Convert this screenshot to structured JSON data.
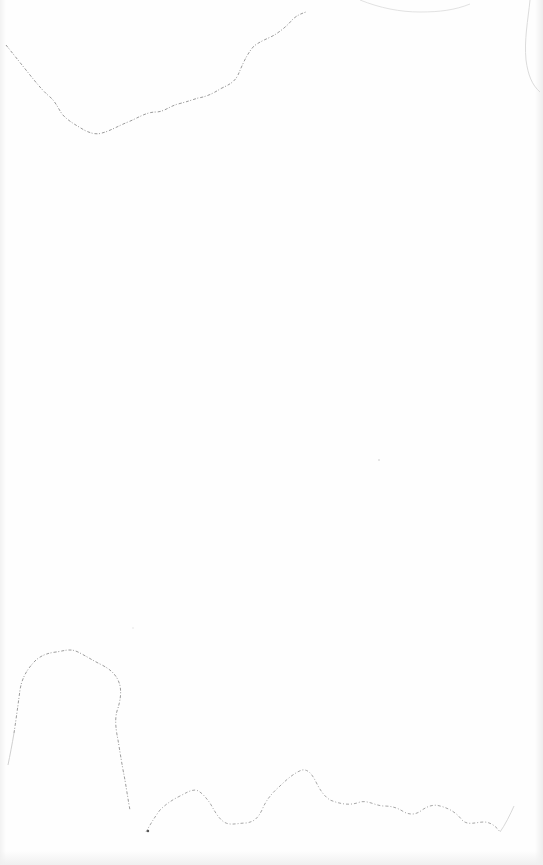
{
  "canvas": {
    "background": "#fefefe",
    "line_color": "#a8a8a8",
    "faint_line_color": "#d6d6d6",
    "caption": ""
  },
  "outlines": [
    {
      "name": "top-contour",
      "description": "wavy torn edge line across upper area"
    },
    {
      "name": "bottom-left-lobe",
      "description": "rounded lobe outline at lower left"
    },
    {
      "name": "bottom-contour",
      "description": "wavy line along the bottom"
    }
  ]
}
